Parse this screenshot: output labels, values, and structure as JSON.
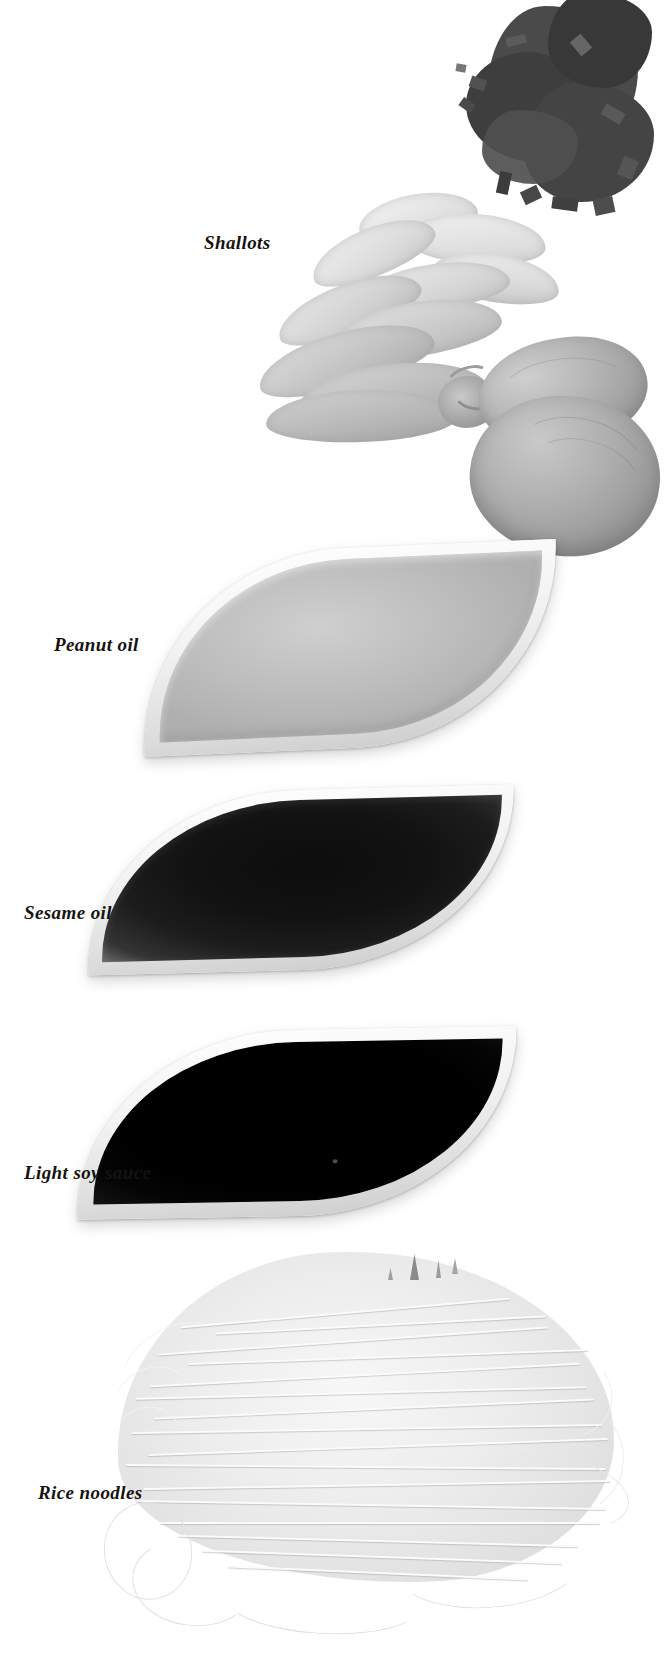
{
  "page": {
    "kind": "cookbook-ingredient-plate",
    "background_color": "#ffffff",
    "width": 634,
    "height": 1657,
    "text_color": "#16120f",
    "caption_style": "bold-italic-serif"
  },
  "labels": {
    "shallots": "Shallots",
    "peanut_oil": "Peanut oil",
    "sesame_oil": "Sesame oil",
    "light_soy_sauce": "Light soy sauce",
    "rice_noodles": "Rice noodles"
  },
  "ingredients": [
    {
      "id": "chopped-herbs",
      "label": "",
      "labeled": false,
      "description": "pile of dark chopped herbs, cropped at top-right corner",
      "tone": "very dark gray",
      "color": "#3f3f3f"
    },
    {
      "id": "shallots",
      "label": "Shallots",
      "labeled": true,
      "description": "bunch of shallots with pale leaves fanning left and two bulbs at right",
      "tone": "light gray / mid gray",
      "color": "#c4c4c4"
    },
    {
      "id": "peanut-oil",
      "label": "Peanut oil",
      "labeled": true,
      "description": "leaf-shaped white dish filled with pale gray oil",
      "tone": "light gray",
      "color": "#bdbdbd"
    },
    {
      "id": "sesame-oil",
      "label": "Sesame oil",
      "labeled": true,
      "description": "leaf-shaped white dish filled with very dark oil",
      "tone": "near black",
      "color": "#151515"
    },
    {
      "id": "light-soy-sauce",
      "label": "Light soy sauce",
      "labeled": true,
      "description": "leaf-shaped white dish filled with solid black sauce",
      "tone": "black",
      "color": "#000000"
    },
    {
      "id": "rice-noodles",
      "label": "Rice noodles",
      "labeled": true,
      "description": "bundle of fine pale rice noodle strands",
      "tone": "near white",
      "color": "#ededed"
    }
  ]
}
